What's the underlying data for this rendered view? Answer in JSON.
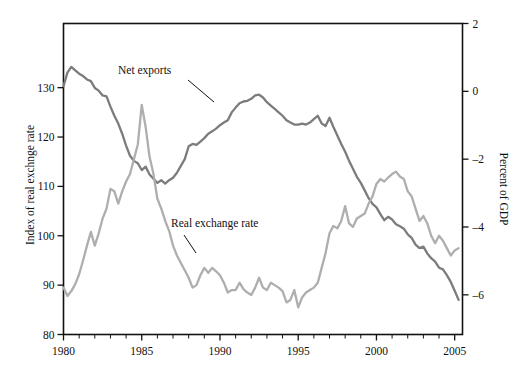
{
  "chart_data": {
    "type": "line",
    "title": "",
    "subtitle": "",
    "xlabel": "",
    "ylabel": "Index of real exchnge rate",
    "y2label": "Percent of GDP",
    "grid": false,
    "legend_position": "inline-annotations",
    "xlim": [
      1980,
      2005.5
    ],
    "ylim": [
      80,
      143
    ],
    "y2lim": [
      -7.17,
      2.0
    ],
    "xticks": [
      1980,
      1985,
      1990,
      1995,
      2000,
      2005
    ],
    "xtick_labels": [
      "1980",
      "1985",
      "1990",
      "1995",
      "2000",
      "2005"
    ],
    "xminor_step": 1,
    "yticks": [
      80,
      90,
      100,
      110,
      120,
      130
    ],
    "ytick_labels": [
      "80",
      "90",
      "100",
      "110",
      "120",
      "130"
    ],
    "y2ticks": [
      2,
      0,
      -2,
      -4,
      -6
    ],
    "y2tick_labels": [
      "2",
      "0",
      "–2",
      "–4",
      "–6"
    ],
    "annotations": [
      {
        "text": "Net exports",
        "x": 1984.2,
        "y_axis": "right",
        "tip_x": 1987.6,
        "tip_y": -1.25
      },
      {
        "text": "Real exchange rate",
        "x": 1987.0,
        "y_axis": "left",
        "tip_x": 1987.6,
        "tip_y": 99.0
      }
    ],
    "series": [
      {
        "name": "Net exports",
        "axis": "right",
        "color": "#7c7c7c",
        "units": "Percent of GDP",
        "x": [
          1980.0,
          1980.25,
          1980.5,
          1980.75,
          1981.0,
          1981.25,
          1981.5,
          1981.75,
          1982.0,
          1982.25,
          1982.5,
          1982.75,
          1983.0,
          1983.25,
          1983.5,
          1983.75,
          1984.0,
          1984.25,
          1984.5,
          1984.75,
          1985.0,
          1985.25,
          1985.5,
          1985.75,
          1986.0,
          1986.25,
          1986.5,
          1986.75,
          1987.0,
          1987.25,
          1987.5,
          1987.75,
          1988.0,
          1988.25,
          1988.5,
          1988.75,
          1989.0,
          1989.25,
          1989.5,
          1989.75,
          1990.0,
          1990.25,
          1990.5,
          1990.75,
          1991.0,
          1991.25,
          1991.5,
          1991.75,
          1992.0,
          1992.25,
          1992.5,
          1992.75,
          1993.0,
          1993.25,
          1993.5,
          1993.75,
          1994.0,
          1994.25,
          1994.5,
          1994.75,
          1995.0,
          1995.25,
          1995.5,
          1995.75,
          1996.0,
          1996.25,
          1996.5,
          1996.75,
          1997.0,
          1997.25,
          1997.5,
          1997.75,
          1998.0,
          1998.25,
          1998.5,
          1998.75,
          1999.0,
          1999.25,
          1999.5,
          1999.75,
          2000.0,
          2000.25,
          2000.5,
          2000.75,
          2001.0,
          2001.25,
          2001.5,
          2001.75,
          2002.0,
          2002.25,
          2002.5,
          2002.75,
          2003.0,
          2003.25,
          2003.5,
          2003.75,
          2004.0,
          2004.25,
          2004.5,
          2004.75,
          2005.0,
          2005.25
        ],
        "values": [
          0.15,
          0.55,
          0.72,
          0.62,
          0.52,
          0.45,
          0.35,
          0.3,
          0.1,
          0.02,
          -0.12,
          -0.15,
          -0.45,
          -0.72,
          -0.95,
          -1.25,
          -1.6,
          -1.9,
          -2.05,
          -2.12,
          -2.32,
          -2.22,
          -2.45,
          -2.58,
          -2.7,
          -2.62,
          -2.72,
          -2.62,
          -2.55,
          -2.4,
          -2.2,
          -2.0,
          -1.62,
          -1.55,
          -1.58,
          -1.48,
          -1.38,
          -1.25,
          -1.18,
          -1.1,
          -1.0,
          -0.92,
          -0.85,
          -0.62,
          -0.48,
          -0.35,
          -0.3,
          -0.28,
          -0.22,
          -0.12,
          -0.1,
          -0.18,
          -0.32,
          -0.42,
          -0.52,
          -0.62,
          -0.72,
          -0.85,
          -0.92,
          -0.98,
          -0.98,
          -0.95,
          -0.98,
          -0.92,
          -0.82,
          -0.72,
          -0.95,
          -1.02,
          -0.78,
          -1.05,
          -1.3,
          -1.55,
          -1.78,
          -2.05,
          -2.28,
          -2.52,
          -2.7,
          -2.92,
          -3.15,
          -3.32,
          -3.42,
          -3.62,
          -3.8,
          -3.7,
          -3.78,
          -3.92,
          -3.98,
          -4.05,
          -4.22,
          -4.32,
          -4.52,
          -4.62,
          -4.58,
          -4.78,
          -4.92,
          -5.02,
          -5.2,
          -5.25,
          -5.42,
          -5.62,
          -5.88,
          -6.15
        ]
      },
      {
        "name": "Real exchange rate",
        "axis": "left",
        "color": "#aeaeae",
        "units": "Index",
        "x": [
          1980.0,
          1980.25,
          1980.5,
          1980.75,
          1981.0,
          1981.25,
          1981.5,
          1981.75,
          1982.0,
          1982.25,
          1982.5,
          1982.75,
          1983.0,
          1983.25,
          1983.5,
          1983.75,
          1984.0,
          1984.25,
          1984.5,
          1984.75,
          1985.0,
          1985.25,
          1985.5,
          1985.75,
          1986.0,
          1986.25,
          1986.5,
          1986.75,
          1987.0,
          1987.25,
          1987.5,
          1987.75,
          1988.0,
          1988.25,
          1988.5,
          1988.75,
          1989.0,
          1989.25,
          1989.5,
          1989.75,
          1990.0,
          1990.25,
          1990.5,
          1990.75,
          1991.0,
          1991.25,
          1991.5,
          1991.75,
          1992.0,
          1992.25,
          1992.5,
          1992.75,
          1993.0,
          1993.25,
          1993.5,
          1993.75,
          1994.0,
          1994.25,
          1994.5,
          1994.75,
          1995.0,
          1995.25,
          1995.5,
          1995.75,
          1996.0,
          1996.25,
          1996.5,
          1996.75,
          1997.0,
          1997.25,
          1997.5,
          1997.75,
          1998.0,
          1998.25,
          1998.5,
          1998.75,
          1999.0,
          1999.25,
          1999.5,
          1999.75,
          2000.0,
          2000.25,
          2000.5,
          2000.75,
          2001.0,
          2001.25,
          2001.5,
          2001.75,
          2002.0,
          2002.25,
          2002.5,
          2002.75,
          2003.0,
          2003.25,
          2003.5,
          2003.75,
          2004.0,
          2004.25,
          2004.5,
          2004.75,
          2005.0,
          2005.25
        ],
        "values": [
          89.5,
          87.8,
          88.8,
          90.2,
          92.2,
          95.0,
          98.0,
          100.8,
          98.0,
          100.5,
          103.5,
          105.5,
          109.5,
          109.0,
          106.5,
          109.0,
          111.0,
          112.5,
          115.5,
          118.5,
          126.5,
          122.0,
          116.0,
          112.5,
          107.5,
          105.5,
          103.0,
          101.0,
          98.0,
          96.0,
          94.5,
          93.0,
          91.5,
          89.5,
          90.0,
          92.0,
          93.5,
          92.5,
          93.5,
          92.8,
          92.0,
          90.5,
          88.5,
          89.0,
          89.0,
          90.5,
          89.2,
          88.5,
          88.0,
          89.5,
          91.5,
          89.5,
          89.0,
          90.5,
          90.0,
          89.5,
          88.8,
          86.5,
          87.0,
          89.0,
          85.5,
          87.5,
          88.5,
          89.0,
          89.5,
          90.5,
          93.5,
          96.5,
          100.5,
          102.0,
          101.5,
          103.0,
          106.0,
          102.5,
          101.8,
          103.5,
          104.0,
          104.5,
          106.5,
          108.0,
          110.5,
          111.5,
          111.0,
          111.8,
          112.5,
          113.0,
          112.0,
          111.5,
          109.0,
          108.0,
          105.5,
          103.0,
          104.0,
          102.5,
          100.0,
          98.5,
          100.0,
          99.0,
          97.5,
          96.0,
          97.0,
          97.5
        ]
      }
    ]
  }
}
